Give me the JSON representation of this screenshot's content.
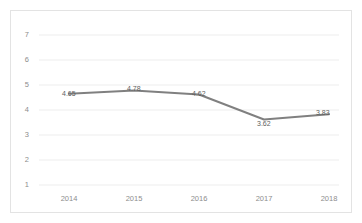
{
  "chart_data": {
    "type": "line",
    "title": "",
    "subtitle": "",
    "xlabel": "",
    "ylabel": "",
    "categories": [
      "2014",
      "2015",
      "2016",
      "2017",
      "2018"
    ],
    "values": [
      4.65,
      4.78,
      4.62,
      3.62,
      3.83
    ],
    "point_labels": [
      "4.65",
      "4.78",
      "4.62",
      "3.62",
      "3.83"
    ],
    "series": [
      {
        "name": "",
        "values": [
          4.65,
          4.78,
          4.62,
          3.62,
          3.83
        ],
        "color": "#808080"
      }
    ],
    "ylim": [
      1,
      7
    ],
    "yticks": [
      1,
      2,
      3,
      4,
      5,
      6,
      7
    ],
    "ytick_labels": [
      "1",
      "2",
      "3",
      "4",
      "5",
      "6",
      "7"
    ],
    "xtick_labels": [
      "2014",
      "2015",
      "2016",
      "2017",
      "2018"
    ],
    "grid": true,
    "grid_axis": "y",
    "grid_color": "#ededed",
    "legend": false,
    "legend_position": "none",
    "markers": false,
    "line_color": "#808080",
    "plot_background": "#ffffff",
    "border_color": "#e3e3e3",
    "tick_label_color": "#8d8d8d",
    "data_label_color": "#5e5e5e"
  }
}
